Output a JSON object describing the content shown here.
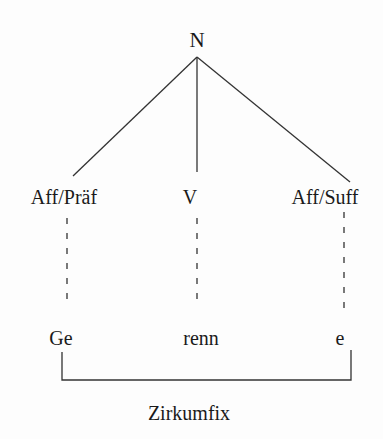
{
  "diagram": {
    "type": "morphological-tree",
    "root": {
      "label": "N"
    },
    "children": [
      {
        "category": "Aff/Präf",
        "morpheme": "Ge"
      },
      {
        "category": "V",
        "morpheme": "renn"
      },
      {
        "category": "Aff/Suff",
        "morpheme": "e"
      }
    ],
    "bracket": {
      "label": "Zirkumfix",
      "spans": [
        "Ge",
        "e"
      ]
    },
    "colors": {
      "background": "#fdfdfd",
      "ink": "#1a1a1a",
      "line": "#333333"
    }
  }
}
